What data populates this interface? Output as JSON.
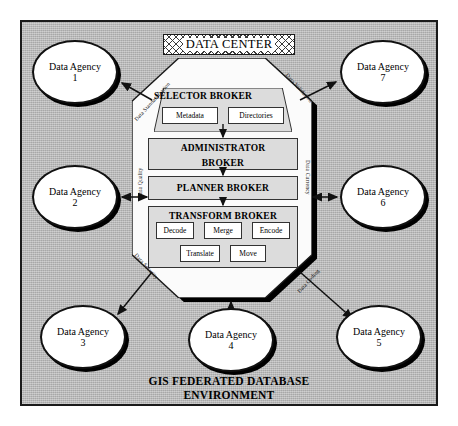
{
  "diagram": {
    "caption_line1": "GIS FEDERATED DATABASE",
    "caption_line2": "ENVIRONMENT",
    "banner_label": "DATA CENTER",
    "background_color": "#b8b8b8",
    "frame_border_color": "#1a1a1a",
    "node_fill_color": "#ffffff",
    "broker_fill_color": "#dcdcdc"
  },
  "brokers": {
    "selector": {
      "title": "SELECTOR BROKER",
      "children": [
        {
          "label": "Metadata"
        },
        {
          "label": "Directories"
        }
      ]
    },
    "administrator": {
      "title_line1": "ADMINISTRATOR",
      "title_line2": "BROKER"
    },
    "planner": {
      "title": "PLANNER BROKER"
    },
    "transform": {
      "title": "TRANSFORM BROKER",
      "operations_row1": [
        {
          "label": "Decode"
        },
        {
          "label": "Merge"
        },
        {
          "label": "Encode"
        }
      ],
      "operations_row2": [
        {
          "label": "Translate"
        },
        {
          "label": "Move"
        }
      ]
    }
  },
  "agencies": [
    {
      "id": 1,
      "name": "Data Agency",
      "number": "1",
      "position": "top-left",
      "arrow": "inbound"
    },
    {
      "id": 2,
      "name": "Data Agency",
      "number": "2",
      "position": "middle-left",
      "arrow": "bidirectional"
    },
    {
      "id": 3,
      "name": "Data Agency",
      "number": "3",
      "position": "bottom-left",
      "arrow": "inbound"
    },
    {
      "id": 4,
      "name": "Data Agency",
      "number": "4",
      "position": "bottom-center",
      "arrow": "bidirectional"
    },
    {
      "id": 5,
      "name": "Data Agency",
      "number": "5",
      "position": "bottom-right",
      "arrow": "inbound"
    },
    {
      "id": 6,
      "name": "Data Agency",
      "number": "6",
      "position": "middle-right",
      "arrow": "bidirectional"
    },
    {
      "id": 7,
      "name": "Data Agency",
      "number": "7",
      "position": "top-right",
      "arrow": "inbound"
    }
  ],
  "edge_labels": {
    "standardization": "Data Standardization",
    "validation": "Data Validation",
    "quality": "Data Quality",
    "currency": "Data Currency",
    "security": "Data Security",
    "coding": "Data Coding"
  }
}
